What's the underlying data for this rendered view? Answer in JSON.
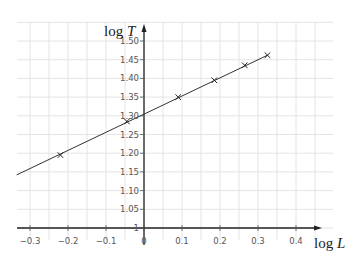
{
  "chart_data": {
    "type": "scatter",
    "title": "",
    "xlabel": "log L",
    "ylabel": "log T",
    "xlabel_parts": {
      "fn": "log ",
      "var": "L"
    },
    "ylabel_parts": {
      "fn": "log ",
      "var": "T"
    },
    "xlim": [
      -0.335,
      0.5
    ],
    "ylim": [
      1.0,
      1.55
    ],
    "x_ticks": [
      -0.3,
      -0.2,
      -0.1,
      0,
      0.1,
      0.2,
      0.3,
      0.4
    ],
    "x_tick_labels": [
      "−0.3",
      "−0.2",
      "−0.1",
      "0",
      "0.1",
      "0.2",
      "0.3",
      "0.4"
    ],
    "y_ticks": [
      1.0,
      1.05,
      1.1,
      1.15,
      1.2,
      1.25,
      1.3,
      1.35,
      1.4,
      1.45,
      1.5
    ],
    "y_tick_labels": [
      "1",
      "1.05",
      "1.10",
      "1.15",
      "1.20",
      "1.25",
      "1.30",
      "1.35",
      "1.40",
      "1.45",
      "1.50"
    ],
    "grid": true,
    "grid_step_x": 0.05,
    "grid_step_y": 0.05,
    "marker": "x",
    "series": [
      {
        "name": "data points",
        "x": [
          -0.22,
          -0.045,
          0.09,
          0.185,
          0.265,
          0.325
        ],
        "y": [
          1.195,
          1.285,
          1.35,
          1.395,
          1.435,
          1.462
        ]
      }
    ],
    "best_fit_line": {
      "x_start": -0.335,
      "y_start": 1.142,
      "x_end": 0.325,
      "y_end": 1.462
    },
    "legend": null
  }
}
